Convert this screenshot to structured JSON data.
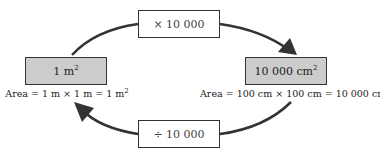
{
  "diagram": {
    "top_operation": "× 10 000",
    "bottom_operation": "÷ 10 000",
    "left_unit": {
      "value": "1 m",
      "power": "2",
      "caption": "Area = 1 m × 1 m = 1 m",
      "caption_power": "2"
    },
    "right_unit": {
      "value": "10 000 cm",
      "power": "2",
      "caption": "Area = 100 cm × 100 cm = 10 000 cm",
      "caption_power": "2"
    },
    "colors": {
      "unit_box_fill": "#cccccc",
      "arrow": "#333333",
      "border": "#333333"
    }
  }
}
